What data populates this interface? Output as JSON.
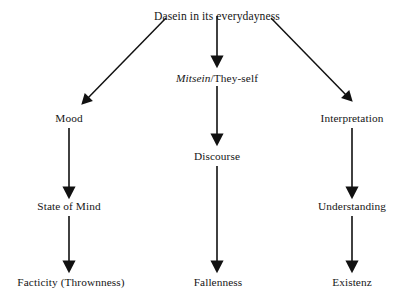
{
  "diagram": {
    "title": "Dasein in its everydayness",
    "background_color": "#ffffff",
    "line_color": "#111111",
    "text_color": "#161616",
    "root": {
      "id": "dasein",
      "label": "Dasein in its everydayness",
      "x": 217,
      "y": 10
    },
    "columns": [
      {
        "id": "left-column",
        "nodes": [
          {
            "id": "mood",
            "label": "Mood",
            "x": 69,
            "y": 112,
            "italic": false
          },
          {
            "id": "state-of-mind",
            "label": "State of Mind",
            "x": 69,
            "y": 200,
            "italic": false
          },
          {
            "id": "facticity",
            "label": "Facticity (Thrownness)",
            "x": 71,
            "y": 276,
            "italic": false
          }
        ]
      },
      {
        "id": "center-column",
        "nodes": [
          {
            "id": "mitsein",
            "label_italic": "Mitsein",
            "label_roman": "/They-self",
            "x": 217,
            "y": 72,
            "italic": true
          },
          {
            "id": "discourse",
            "label": "Discourse",
            "x": 217,
            "y": 150,
            "italic": false
          },
          {
            "id": "fallenness",
            "label": "Fallenness",
            "x": 218,
            "y": 276,
            "italic": false
          }
        ]
      },
      {
        "id": "right-column",
        "nodes": [
          {
            "id": "interpretation",
            "label": "Interpretation",
            "x": 352,
            "y": 112,
            "italic": false
          },
          {
            "id": "understanding",
            "label": "Understanding",
            "x": 352,
            "y": 200,
            "italic": false
          },
          {
            "id": "existenz",
            "label": "Existenz",
            "x": 352,
            "y": 276,
            "italic": true
          }
        ]
      }
    ],
    "edges": [
      {
        "id": "dasein-to-mood",
        "from": "dasein",
        "to": "mood",
        "kind": "diagonal-left"
      },
      {
        "id": "dasein-to-mitsein",
        "from": "dasein",
        "to": "mitsein",
        "kind": "vertical"
      },
      {
        "id": "dasein-to-interpretation",
        "from": "dasein",
        "to": "interpretation",
        "kind": "diagonal-right"
      },
      {
        "id": "mood-to-state-of-mind",
        "from": "mood",
        "to": "state-of-mind",
        "kind": "vertical"
      },
      {
        "id": "mitsein-to-discourse",
        "from": "mitsein",
        "to": "discourse",
        "kind": "vertical"
      },
      {
        "id": "interpretation-to-understanding",
        "from": "interpretation",
        "to": "understanding",
        "kind": "vertical"
      },
      {
        "id": "state-of-mind-to-facticity",
        "from": "state-of-mind",
        "to": "facticity",
        "kind": "vertical"
      },
      {
        "id": "discourse-to-fallenness",
        "from": "discourse",
        "to": "fallenness",
        "kind": "vertical"
      },
      {
        "id": "understanding-to-existenz",
        "from": "understanding",
        "to": "existenz",
        "kind": "vertical"
      }
    ]
  }
}
